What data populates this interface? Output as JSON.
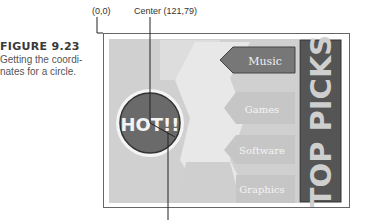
{
  "caption": {
    "figure_label": "FIGURE 9.23",
    "text_line1": "Getting the coordi-",
    "text_line2": "nates for a circle."
  },
  "annotations": {
    "origin_label": "(0,0)",
    "center_label": "Center (121,79)",
    "center": {
      "x": 121,
      "y": 79
    }
  },
  "image_map": {
    "hot_button": "HOT!!",
    "menu_items": [
      {
        "label": "Music",
        "highlighted": true
      },
      {
        "label": "Games",
        "highlighted": false
      },
      {
        "label": "Software",
        "highlighted": false
      },
      {
        "label": "Graphics",
        "highlighted": false
      }
    ],
    "banner": "TOP PICKS"
  },
  "colors": {
    "circle_fill": "#6a6a6a",
    "circle_ring": "#ffffff",
    "active_item": "#7a7a7a",
    "inactive_item": "#c4c4c4",
    "background": "#d2d2d2",
    "banner_bg": "#555555",
    "banner_text": "#cfcfcf"
  }
}
